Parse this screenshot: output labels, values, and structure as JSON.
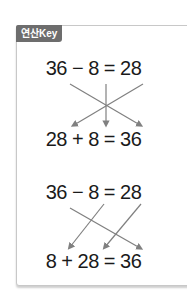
{
  "label": "연산Key",
  "equations": [
    {
      "top": "36 − 8 = 28",
      "bottom": "28 + 8 = 36"
    },
    {
      "top": "36 − 8 = 28",
      "bottom": "8 + 28 = 36"
    }
  ],
  "colors": {
    "arrow": "#808080",
    "tag": "#6d6d6d"
  }
}
